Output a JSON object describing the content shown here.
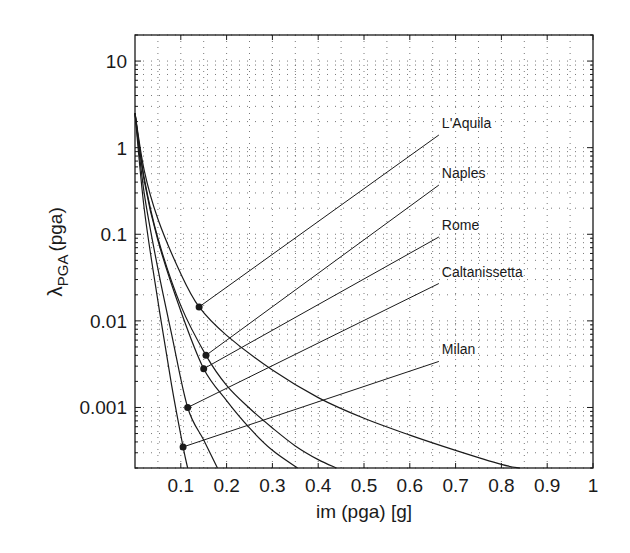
{
  "chart_data": {
    "type": "line",
    "title": "",
    "xlabel": "im (pga) [g]",
    "ylabel": "λ_PGA (pga)",
    "ylabel_main": "λ",
    "ylabel_sub": "PGA",
    "ylabel_suffix": "(pga)",
    "xscale": "linear",
    "yscale": "log",
    "xlim": [
      0,
      1
    ],
    "ylim": [
      0.0002,
      20
    ],
    "grid": true,
    "grid_style": "dotted",
    "legend": "none (inline labels with leader lines)",
    "x_ticks": [
      0.1,
      0.2,
      0.3,
      0.4,
      0.5,
      0.6,
      0.7,
      0.8,
      0.9,
      1
    ],
    "x_tick_labels": [
      "0.1",
      "0.2",
      "0.3",
      "0.4",
      "0.5",
      "0.6",
      "0.7",
      "0.8",
      "0.9",
      "1"
    ],
    "y_ticks": [
      10,
      1,
      0.1,
      0.01,
      0.001
    ],
    "y_tick_labels": [
      "10",
      "1",
      "0.1",
      "0.01",
      "0.001"
    ],
    "series": [
      {
        "name": "L'Aquila",
        "x": [
          0.0,
          0.02,
          0.05,
          0.1,
          0.14,
          0.2,
          0.3,
          0.4,
          0.5,
          0.6,
          0.7,
          0.8,
          0.84
        ],
        "y": [
          2.5,
          0.55,
          0.15,
          0.035,
          0.0145,
          0.0068,
          0.0027,
          0.0013,
          0.00075,
          0.00048,
          0.00032,
          0.00022,
          0.0002
        ],
        "marker": {
          "x": 0.14,
          "y": 0.0145
        },
        "label_anchor": {
          "x": 0.67,
          "y": 1.4
        }
      },
      {
        "name": "Naples",
        "x": [
          0.0,
          0.02,
          0.05,
          0.1,
          0.155,
          0.2,
          0.25,
          0.3,
          0.35,
          0.4,
          0.44
        ],
        "y": [
          2.5,
          0.45,
          0.09,
          0.015,
          0.004,
          0.0018,
          0.00098,
          0.00058,
          0.00036,
          0.00025,
          0.0002
        ],
        "marker": {
          "x": 0.155,
          "y": 0.004
        },
        "label_anchor": {
          "x": 0.67,
          "y": 0.37
        }
      },
      {
        "name": "Rome",
        "x": [
          0.0,
          0.02,
          0.05,
          0.1,
          0.15,
          0.2,
          0.25,
          0.3,
          0.355
        ],
        "y": [
          2.5,
          0.42,
          0.085,
          0.013,
          0.0028,
          0.0012,
          0.00058,
          0.00032,
          0.0002
        ],
        "marker": {
          "x": 0.15,
          "y": 0.0028
        },
        "label_anchor": {
          "x": 0.67,
          "y": 0.093
        }
      },
      {
        "name": "Caltanissetta",
        "x": [
          0.0,
          0.02,
          0.05,
          0.08,
          0.115,
          0.15,
          0.18
        ],
        "y": [
          2.5,
          0.3,
          0.04,
          0.007,
          0.001,
          0.00042,
          0.0002
        ],
        "marker": {
          "x": 0.115,
          "y": 0.001
        },
        "label_anchor": {
          "x": 0.67,
          "y": 0.027
        }
      },
      {
        "name": "Milan",
        "x": [
          0.0,
          0.02,
          0.05,
          0.08,
          0.105,
          0.115
        ],
        "y": [
          2.5,
          0.2,
          0.017,
          0.0018,
          0.00035,
          0.0002
        ],
        "marker": {
          "x": 0.105,
          "y": 0.00035
        },
        "label_anchor": {
          "x": 0.67,
          "y": 0.0034
        }
      }
    ]
  },
  "colors": {
    "line": "#1a1a1a",
    "grid": "#555555",
    "background": "#ffffff"
  }
}
